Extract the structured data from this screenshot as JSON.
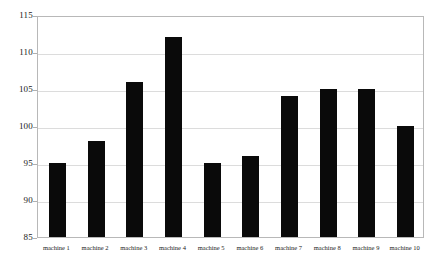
{
  "chart_data": {
    "type": "bar",
    "title": "",
    "xlabel": "",
    "ylabel": "",
    "categories": [
      "machine 1",
      "machine 2",
      "machine 3",
      "machine 4",
      "machine 5",
      "machine 6",
      "machine 7",
      "machine 8",
      "machine 9",
      "machine 10"
    ],
    "values": [
      95,
      98,
      106,
      112,
      95,
      96,
      104,
      105,
      105,
      100
    ],
    "ylim": [
      85,
      115
    ],
    "yticks": [
      85,
      90,
      95,
      100,
      105,
      110,
      115
    ],
    "grid": "horizontal",
    "legend": "none",
    "bar_color": "#0a0a0a",
    "grid_color": "#dcdcdc",
    "frame_color": "#b8b8b8",
    "background_color": "#ffffff"
  }
}
